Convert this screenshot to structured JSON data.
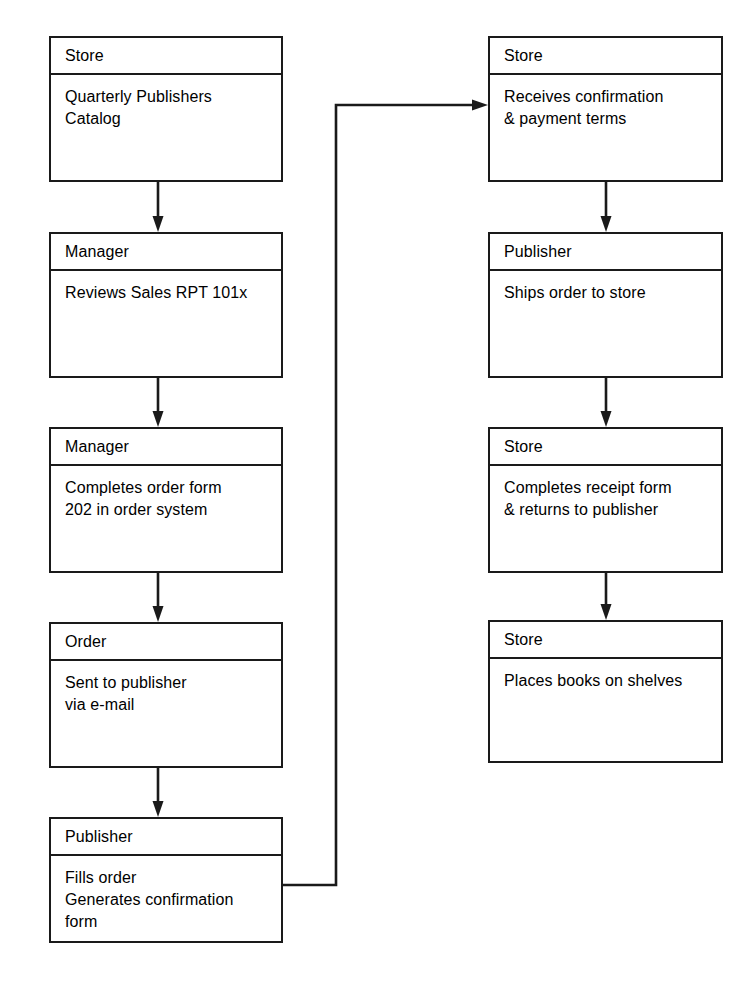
{
  "diagram": {
    "type": "flowchart",
    "background_color": "#ffffff",
    "line_color": "#1a1a1a",
    "text_color": "#000000",
    "columns": [
      {
        "name": "left-column",
        "nodes": [
          {
            "id": "n1",
            "header": "Store",
            "body": "Quarterly Publishers\nCatalog"
          },
          {
            "id": "n2",
            "header": "Manager",
            "body": "Reviews Sales RPT 101x"
          },
          {
            "id": "n3",
            "header": "Manager",
            "body": "Completes order form\n202 in order system"
          },
          {
            "id": "n4",
            "header": "Order",
            "body": "Sent to publisher\nvia e-mail"
          },
          {
            "id": "n5",
            "header": "Publisher",
            "body": "Fills order\nGenerates confirmation\nform"
          }
        ]
      },
      {
        "name": "right-column",
        "nodes": [
          {
            "id": "n6",
            "header": "Store",
            "body": "Receives confirmation\n& payment terms"
          },
          {
            "id": "n7",
            "header": "Publisher",
            "body": "Ships order to store"
          },
          {
            "id": "n8",
            "header": "Store",
            "body": "Completes receipt form\n& returns to publisher"
          },
          {
            "id": "n9",
            "header": "Store",
            "body": "Places books on shelves"
          }
        ]
      }
    ],
    "connectors": [
      {
        "id": "c1",
        "from": "n1",
        "to": "n2",
        "kind": "arrow-down"
      },
      {
        "id": "c2",
        "from": "n2",
        "to": "n3",
        "kind": "arrow-down"
      },
      {
        "id": "c3",
        "from": "n3",
        "to": "n4",
        "kind": "arrow-down"
      },
      {
        "id": "c4",
        "from": "n4",
        "to": "n5",
        "kind": "arrow-down"
      },
      {
        "id": "c5",
        "from": "n5",
        "to": "n6",
        "kind": "elbow-right-up-right"
      },
      {
        "id": "c6",
        "from": "n6",
        "to": "n7",
        "kind": "arrow-down"
      },
      {
        "id": "c7",
        "from": "n7",
        "to": "n8",
        "kind": "arrow-down"
      },
      {
        "id": "c8",
        "from": "n8",
        "to": "n9",
        "kind": "arrow-down"
      }
    ]
  }
}
